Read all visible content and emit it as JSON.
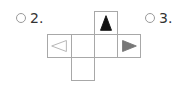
{
  "options": [
    {
      "label": "2.",
      "selected": false
    },
    {
      "label": "3.",
      "selected": false
    }
  ],
  "net": {
    "faces": [
      {
        "position": "top",
        "symbol": "triangle-up",
        "fill": "#111111",
        "stroke": "#111111"
      },
      {
        "position": "middle-left",
        "symbol": "triangle-left-outline",
        "fill": "none",
        "stroke": "#b0b0b0"
      },
      {
        "position": "middle-center-left",
        "symbol": "blank"
      },
      {
        "position": "middle-center-right",
        "symbol": "blank"
      },
      {
        "position": "middle-right",
        "symbol": "triangle-right",
        "fill": "#777777",
        "stroke": "#777777"
      },
      {
        "position": "bottom",
        "symbol": "blank"
      }
    ]
  }
}
